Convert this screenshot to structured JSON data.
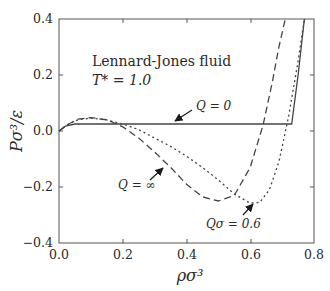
{
  "chart_data": {
    "type": "line",
    "title": "",
    "annotation_title": "Lennard-Jones fluid",
    "annotation_temp": "T* = 1.0",
    "xlabel": "ρσ³",
    "ylabel": "Pσ³/ε",
    "xlim": [
      0.0,
      0.8
    ],
    "ylim": [
      -0.4,
      0.4
    ],
    "xticks": [
      "0.0",
      "0.2",
      "0.4",
      "0.6",
      "0.8"
    ],
    "yticks": [
      "0.4",
      "0.2",
      "0.0",
      "−0.2",
      "−0.4"
    ],
    "grid": false,
    "legend": "inline-labels",
    "series": [
      {
        "name": "Q = 0",
        "style": "solid",
        "x": [
          0.0,
          0.02,
          0.05,
          0.1,
          0.2,
          0.3,
          0.4,
          0.5,
          0.6,
          0.7,
          0.73,
          0.75,
          0.77
        ],
        "y": [
          0.0,
          0.018,
          0.025,
          0.025,
          0.025,
          0.025,
          0.025,
          0.025,
          0.025,
          0.025,
          0.025,
          0.2,
          0.4
        ]
      },
      {
        "name": "Q = ∞",
        "style": "dashed",
        "x": [
          0.0,
          0.03,
          0.06,
          0.1,
          0.15,
          0.2,
          0.25,
          0.3,
          0.35,
          0.4,
          0.45,
          0.5,
          0.55,
          0.6,
          0.64,
          0.67,
          0.69,
          0.71
        ],
        "y": [
          0.0,
          0.025,
          0.042,
          0.048,
          0.04,
          0.015,
          -0.025,
          -0.075,
          -0.13,
          -0.19,
          -0.235,
          -0.25,
          -0.23,
          -0.13,
          0.02,
          0.18,
          0.3,
          0.4
        ]
      },
      {
        "name": "Qσ = 0.6",
        "style": "dotted",
        "x": [
          0.0,
          0.03,
          0.06,
          0.1,
          0.15,
          0.2,
          0.25,
          0.3,
          0.35,
          0.4,
          0.45,
          0.5,
          0.55,
          0.6,
          0.63,
          0.66,
          0.69,
          0.72,
          0.75,
          0.77
        ],
        "y": [
          0.0,
          0.025,
          0.04,
          0.046,
          0.04,
          0.025,
          0.005,
          -0.025,
          -0.055,
          -0.09,
          -0.13,
          -0.175,
          -0.225,
          -0.258,
          -0.255,
          -0.21,
          -0.11,
          0.05,
          0.25,
          0.4
        ]
      }
    ],
    "annotations": [
      {
        "text": "Q = 0",
        "arrow_to": [
          0.32,
          0.025
        ]
      },
      {
        "text": "Q = ∞",
        "arrow_to": [
          0.28,
          -0.06
        ]
      },
      {
        "text": "Qσ = 0.6",
        "arrow_to": [
          0.6,
          -0.245
        ]
      }
    ]
  }
}
